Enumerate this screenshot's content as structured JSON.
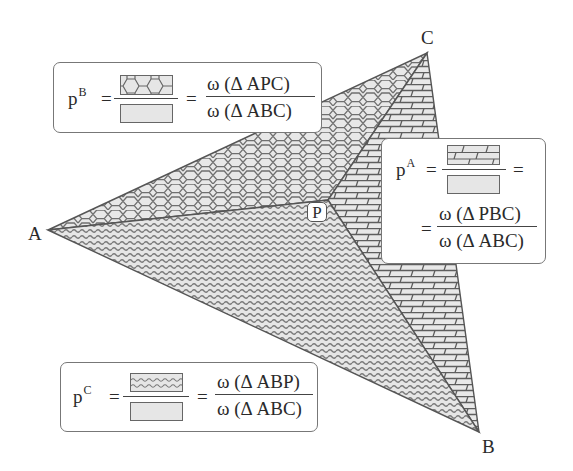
{
  "vertices": {
    "A": {
      "label": "A",
      "x": 48,
      "y": 230
    },
    "B": {
      "label": "B",
      "x": 479,
      "y": 432
    },
    "C": {
      "label": "C",
      "x": 427,
      "y": 53
    },
    "P": {
      "label": "P",
      "x": 328,
      "y": 200
    }
  },
  "regions": [
    {
      "name": "triangle-APC",
      "pattern": "hexagon"
    },
    {
      "name": "triangle-PBC",
      "pattern": "brick"
    },
    {
      "name": "triangle-ABP",
      "pattern": "wave"
    }
  ],
  "equations": {
    "pB": {
      "symbol": "p",
      "superscript": "B",
      "eq1": "=",
      "eq2": "=",
      "numerator": "ω (Δ APC)",
      "denominator": "ω (Δ ABC)",
      "numerator_pattern": "hexagon"
    },
    "pA": {
      "symbol": "p",
      "superscript": "A",
      "eq1": "=",
      "eq2": "=",
      "eq3": "=",
      "numerator": "ω (Δ PBC)",
      "denominator": "ω (Δ ABC)",
      "numerator_pattern": "brick"
    },
    "pC": {
      "symbol": "p",
      "superscript": "C",
      "eq1": "=",
      "eq2": "=",
      "numerator": "ω (Δ ABP)",
      "denominator": "ω (Δ ABC)",
      "numerator_pattern": "wave"
    }
  },
  "colors": {
    "fill": "#e4e4e4",
    "pattern_stroke": "#6a6a6a",
    "edge": "#555555",
    "text": "#2a2a2a"
  }
}
